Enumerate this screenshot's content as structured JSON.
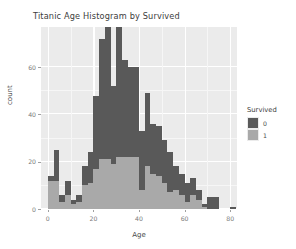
{
  "chart_data": {
    "type": "bar",
    "subtype": "stacked-histogram",
    "title": "Titanic Age Histogram by Survived",
    "xlabel": "Age",
    "ylabel": "count",
    "xlim": [
      -3,
      83
    ],
    "ylim": [
      0,
      77
    ],
    "binwidth": 2.5,
    "grid": true,
    "legend": {
      "title": "Survived",
      "position": "right",
      "entries": [
        {
          "label": "0",
          "color": "#595959"
        },
        {
          "label": "1",
          "color": "#A9A9A9"
        }
      ]
    },
    "xticks": [
      {
        "value": 0,
        "label": "0"
      },
      {
        "value": 20,
        "label": "20"
      },
      {
        "value": 40,
        "label": "40"
      },
      {
        "value": 60,
        "label": "60"
      },
      {
        "value": 80,
        "label": "80"
      }
    ],
    "yticks": [
      {
        "value": 0,
        "label": "0"
      },
      {
        "value": 20,
        "label": "20"
      },
      {
        "value": 40,
        "label": "40"
      },
      {
        "value": 60,
        "label": "60"
      }
    ],
    "bin_centers": [
      1.25,
      3.75,
      6.25,
      8.75,
      11.25,
      13.75,
      16.25,
      18.75,
      21.25,
      23.75,
      26.25,
      28.75,
      31.25,
      33.75,
      36.25,
      38.75,
      41.25,
      43.75,
      46.25,
      48.75,
      51.25,
      53.75,
      56.25,
      58.75,
      61.25,
      63.75,
      66.25,
      68.75,
      71.25,
      73.75,
      76.25,
      78.75,
      81.25
    ],
    "series": [
      {
        "name": "0",
        "label": "Survived = 0",
        "color": "#595959",
        "values": [
          2,
          13,
          3,
          6,
          2,
          3,
          8,
          13,
          31,
          51,
          68,
          33,
          56,
          41,
          38,
          38,
          25,
          31,
          21,
          21,
          18,
          17,
          10,
          9,
          8,
          7,
          4,
          1,
          5,
          5,
          0,
          0,
          1
        ]
      },
      {
        "name": "1",
        "label": "Survived = 1",
        "color": "#A9A9A9",
        "values": [
          12,
          12,
          3,
          6,
          2,
          3,
          10,
          11,
          17,
          21,
          21,
          19,
          22,
          22,
          22,
          22,
          8,
          18,
          15,
          14,
          11,
          7,
          8,
          6,
          3,
          6,
          4,
          1,
          0,
          0,
          0,
          0,
          0
        ]
      }
    ],
    "totals": [
      14,
      25,
      6,
      12,
      4,
      6,
      18,
      24,
      48,
      72,
      89,
      52,
      78,
      63,
      60,
      60,
      33,
      49,
      36,
      35,
      29,
      24,
      18,
      15,
      11,
      13,
      8,
      2,
      5,
      5,
      0,
      0,
      1
    ]
  }
}
